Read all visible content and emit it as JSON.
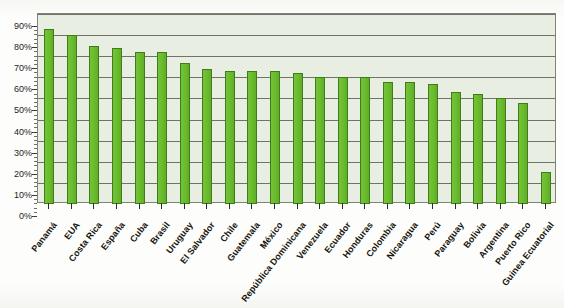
{
  "title_partial": "",
  "chart_data": {
    "type": "bar",
    "title": "",
    "subtitle": "",
    "xlabel": "",
    "ylabel": "",
    "ylim": [
      0,
      90
    ],
    "ytick_step": 10,
    "ytick_labels": [
      "90%",
      "80%",
      "70%",
      "60%",
      "50%",
      "40%",
      "30%",
      "20%",
      "10%",
      "0%"
    ],
    "ytick_values": [
      90,
      80,
      70,
      60,
      50,
      40,
      30,
      20,
      10,
      0
    ],
    "grid": true,
    "legend": "none",
    "value_unit": "%",
    "bar_color": "#6cbe2e",
    "bar_outline_color": "#3e7d18",
    "plot_background": "#e9eee2",
    "gridline_color": "#70736a",
    "categories": [
      "Panamá",
      "EUA",
      "Costa Rica",
      "España",
      "Cuba",
      "Brasil",
      "Uruguay",
      "El Salvador",
      "Chile",
      "Guatemala",
      "México",
      "República Dominicana",
      "Venezuela",
      "Ecuador",
      "Honduras",
      "Colombia",
      "Nicaragua",
      "Perú",
      "Paraguay",
      "Bolivia",
      "Argentina",
      "Puerto Rico",
      "Guinea Ecuatorial"
    ],
    "values": [
      83,
      80,
      75,
      74,
      72,
      72,
      67,
      64,
      63,
      63,
      63,
      62,
      60,
      60,
      60,
      58,
      58,
      57,
      53,
      52,
      50,
      48,
      15
    ]
  }
}
